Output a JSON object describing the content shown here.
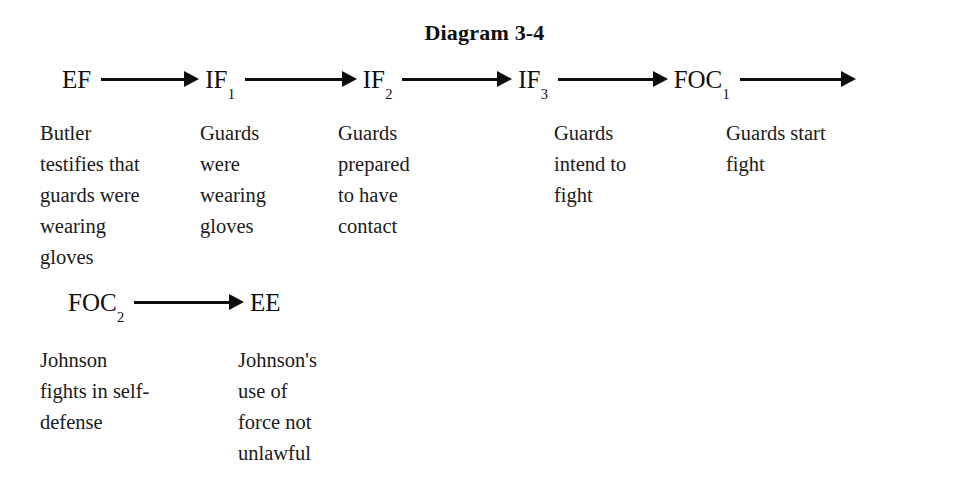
{
  "title": "Diagram 3-4",
  "colors": {
    "ink": "#141414",
    "background": "#ffffff",
    "arrow": "#0d0d0d"
  },
  "rows": [
    {
      "id": "row-1",
      "nodes": [
        {
          "id": "node-ef",
          "base": "EF",
          "sub": ""
        },
        {
          "id": "node-if1",
          "base": "IF",
          "sub": "1"
        },
        {
          "id": "node-if2",
          "base": "IF",
          "sub": "2"
        },
        {
          "id": "node-if3",
          "base": "IF",
          "sub": "3"
        },
        {
          "id": "node-foc1",
          "base": "FOC",
          "sub": "1"
        }
      ],
      "arrows": [
        {
          "id": "arrow-ef-if1",
          "from": "EF",
          "to": "IF1"
        },
        {
          "id": "arrow-if1-if2",
          "from": "IF1",
          "to": "IF2"
        },
        {
          "id": "arrow-if2-if3",
          "from": "IF2",
          "to": "IF3"
        },
        {
          "id": "arrow-if3-foc1",
          "from": "IF3",
          "to": "FOC1"
        },
        {
          "id": "arrow-foc1-out",
          "from": "FOC1",
          "to": ""
        }
      ],
      "columns": [
        {
          "id": "col-r1-c1",
          "node": "EF",
          "text": "Butler\ntestifies that\nguards were\nwearing\ngloves"
        },
        {
          "id": "col-r1-c2",
          "node": "IF1",
          "text": "Guards\nwere\nwearing\ngloves"
        },
        {
          "id": "col-r1-c3",
          "node": "IF2",
          "text": "Guards\nprepared\nto have\ncontact"
        },
        {
          "id": "col-r1-c4",
          "node": "IF3",
          "text": "Guards\nintend to\nfight"
        },
        {
          "id": "col-r1-c5",
          "node": "FOC1",
          "text": "Guards start\nfight"
        }
      ]
    },
    {
      "id": "row-2",
      "nodes": [
        {
          "id": "node-foc2",
          "base": "FOC",
          "sub": "2"
        },
        {
          "id": "node-ee",
          "base": "EE",
          "sub": ""
        }
      ],
      "arrows": [
        {
          "id": "arrow-foc2-ee",
          "from": "FOC2",
          "to": "EE"
        }
      ],
      "columns": [
        {
          "id": "col-r2-c1",
          "node": "FOC2",
          "text": "Johnson\nfights in self-\ndefense"
        },
        {
          "id": "col-r2-c2",
          "node": "EE",
          "text": "Johnson's\nuse of\nforce not\nunlawful"
        }
      ]
    }
  ]
}
